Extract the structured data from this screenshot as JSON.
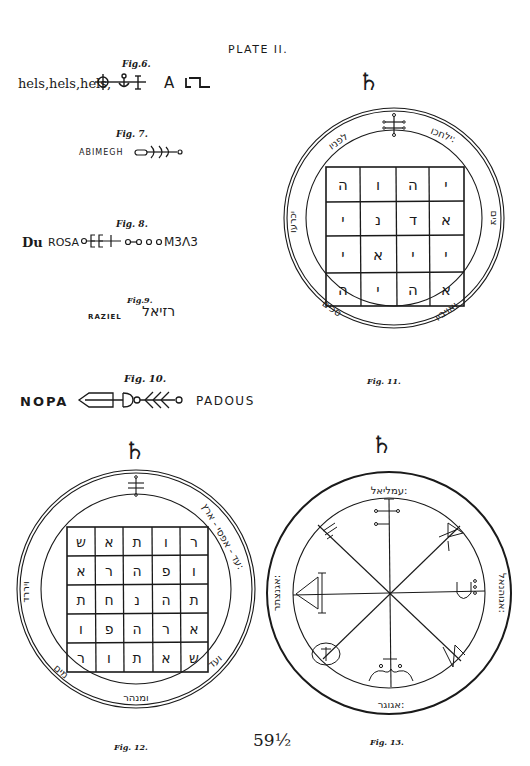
{
  "page": {
    "title": "PLATE II.",
    "page_number": "59½"
  },
  "fig6": {
    "label": "Fig.6.",
    "text": "hels,hels,hels,",
    "letters": "A",
    "symbols": [
      "circle-cross-glyph",
      "anchor-glyph",
      "bar-glyph",
      "step-glyph"
    ]
  },
  "fig7": {
    "label": "Fig. 7.",
    "name": "ABIMEGH",
    "symbol": "trident-line-glyph"
  },
  "fig8": {
    "label": "Fig. 8.",
    "prefix": "Du",
    "name": "ROSA",
    "suffix": "M3Λ3",
    "symbol": "ring-chain-glyph"
  },
  "fig9": {
    "label": "Fig.9.",
    "name": "RAZIEL",
    "hebrew": "רזיאל"
  },
  "fig10": {
    "label": "Fig. 10.",
    "left": "NOPA",
    "right": "PADOUS",
    "symbol": "arrow-branch-glyph"
  },
  "fig11": {
    "label": "Fig. 11.",
    "planet_symbol": "♄",
    "ring_texts": {
      "top_right": "ילחכו:",
      "top_left": "לפניו",
      "left": "יכרעו",
      "right": "צים",
      "bottom_left": "סכים",
      "bottom_right": "ואויביו"
    },
    "grid": [
      [
        "ה",
        "ו",
        "ה",
        "י"
      ],
      [
        "י",
        "נ",
        "ד",
        "א"
      ],
      [
        "י",
        "א",
        "י",
        "י"
      ],
      [
        "ה",
        "י",
        "ה",
        "א"
      ]
    ]
  },
  "fig12": {
    "label": "Fig. 12.",
    "planet_symbol": "♄",
    "ring_texts": {
      "right": "עד - אפסי - ארץ:",
      "left": "ויררד",
      "bottom_left": "מים",
      "bottom": "ומנהר",
      "bottom_right": "ועד"
    },
    "grid": [
      [
        "ש",
        "א",
        "ת",
        "ו",
        "ר"
      ],
      [
        "א",
        "ר",
        "ה",
        "פ",
        "ו"
      ],
      [
        "ת",
        "ח",
        "נ",
        "ה",
        "ת"
      ],
      [
        "ו",
        "פ",
        "ה",
        "ר",
        "א"
      ],
      [
        "ר",
        "ו",
        "ת",
        "א",
        "ש"
      ]
    ]
  },
  "fig13": {
    "label": "Fig. 13.",
    "planet_symbol": "♄",
    "ring_texts": {
      "top": "עמליאל:",
      "left": "אגנצתר:",
      "right": "אגוהנאל:",
      "bottom": "אגוגר:"
    }
  }
}
